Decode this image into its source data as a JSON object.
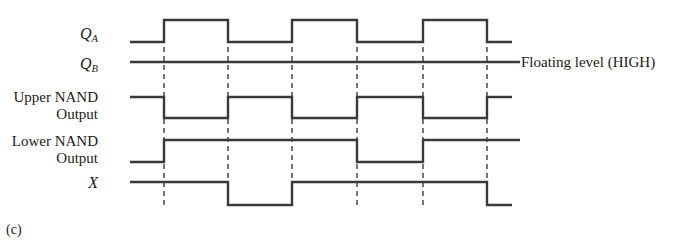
{
  "figure": {
    "caption": "(c)",
    "annotation": "Floating level (HIGH)",
    "signals": [
      {
        "id": "QA",
        "label_main": "Q",
        "label_sub": "A",
        "label_line2": ""
      },
      {
        "id": "QB",
        "label_main": "Q",
        "label_sub": "B",
        "label_line2": ""
      },
      {
        "id": "UPPER",
        "label_main": "Upper NAND",
        "label_sub": "",
        "label_line2": "Output"
      },
      {
        "id": "LOWER",
        "label_main": "Lower NAND",
        "label_sub": "",
        "label_line2": "Output"
      },
      {
        "id": "X",
        "label_main": "X",
        "label_sub": "",
        "label_line2": ""
      }
    ],
    "colors": {
      "trace": "#3a3a3a",
      "dashed": "#3a3a3a",
      "background": "#ffffff",
      "text": "#1a1a1a"
    }
  },
  "chart_data": {
    "type": "line",
    "title": "",
    "subtitle": "",
    "xlabel": "",
    "ylabel": "",
    "grid": "vertical-dashed",
    "legend": "none",
    "xlim": [
      130,
      520
    ],
    "edge_times": [
      164,
      228,
      292,
      357,
      423,
      487
    ],
    "trace_start_x": 130,
    "trace_end_x": 520,
    "levels": {
      "QA": {
        "high_y": 20,
        "low_y": 42
      },
      "QB": {
        "high_y": 62,
        "low_y": 62
      },
      "UPPER": {
        "high_y": 97,
        "low_y": 118
      },
      "LOWER": {
        "high_y": 140,
        "low_y": 162
      },
      "X": {
        "high_y": 182,
        "low_y": 205
      }
    },
    "series": [
      {
        "name": "QA",
        "note": "toggles at each edge, starts LOW",
        "segments": [
          {
            "x0": 130,
            "x1": 164,
            "level": "low"
          },
          {
            "x0": 164,
            "x1": 228,
            "level": "high"
          },
          {
            "x0": 228,
            "x1": 292,
            "level": "low"
          },
          {
            "x0": 292,
            "x1": 357,
            "level": "high"
          },
          {
            "x0": 357,
            "x1": 423,
            "level": "low"
          },
          {
            "x0": 423,
            "x1": 487,
            "level": "high"
          },
          {
            "x0": 487,
            "x1": 512,
            "level": "low"
          }
        ]
      },
      {
        "name": "QB",
        "note": "constant floating HIGH level",
        "segments": [
          {
            "x0": 130,
            "x1": 520,
            "level": "high"
          }
        ]
      },
      {
        "name": "UPPER",
        "note": "complement of QA, starts HIGH",
        "segments": [
          {
            "x0": 130,
            "x1": 164,
            "level": "high"
          },
          {
            "x0": 164,
            "x1": 228,
            "level": "low"
          },
          {
            "x0": 228,
            "x1": 292,
            "level": "high"
          },
          {
            "x0": 292,
            "x1": 357,
            "level": "low"
          },
          {
            "x0": 357,
            "x1": 423,
            "level": "high"
          },
          {
            "x0": 423,
            "x1": 487,
            "level": "low"
          },
          {
            "x0": 487,
            "x1": 512,
            "level": "high"
          }
        ]
      },
      {
        "name": "LOWER",
        "note": "low, then high, dips low for one interval, then high",
        "segments": [
          {
            "x0": 130,
            "x1": 164,
            "level": "low"
          },
          {
            "x0": 164,
            "x1": 357,
            "level": "high"
          },
          {
            "x0": 357,
            "x1": 423,
            "level": "low"
          },
          {
            "x0": 423,
            "x1": 520,
            "level": "high"
          }
        ]
      },
      {
        "name": "X",
        "note": "high, dips low for one interval, high, then falls at last edge",
        "segments": [
          {
            "x0": 130,
            "x1": 228,
            "level": "high"
          },
          {
            "x0": 228,
            "x1": 292,
            "level": "low"
          },
          {
            "x0": 292,
            "x1": 487,
            "level": "high"
          },
          {
            "x0": 487,
            "x1": 512,
            "level": "low"
          }
        ]
      }
    ],
    "dashed_guides": [
      {
        "x": 164,
        "y0": 20,
        "y1": 205
      },
      {
        "x": 228,
        "y0": 20,
        "y1": 205
      },
      {
        "x": 292,
        "y0": 20,
        "y1": 205
      },
      {
        "x": 357,
        "y0": 20,
        "y1": 205
      },
      {
        "x": 423,
        "y0": 20,
        "y1": 205
      },
      {
        "x": 487,
        "y0": 20,
        "y1": 205
      }
    ]
  }
}
